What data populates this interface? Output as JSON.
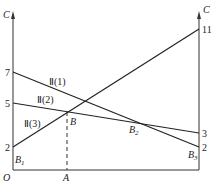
{
  "diagram": {
    "title": "",
    "axes": {
      "left_axis_label": "C",
      "right_axis_label": "C",
      "origin_label": "O",
      "x_marker_label": "A"
    },
    "left_ticks": [
      "7",
      "5",
      "2"
    ],
    "right_ticks": [
      "11",
      "3",
      "2"
    ],
    "lines": [
      {
        "name": "II (1)",
        "left_value": 7,
        "right_value": 2
      },
      {
        "name": "II (2)",
        "left_value": 5,
        "right_value": 3
      },
      {
        "name": "II (3)",
        "left_value": 2,
        "right_value": 11
      }
    ],
    "points": {
      "B1": "B",
      "B1_sub": "1",
      "B": "B",
      "B2": "B",
      "B2_sub": "2",
      "B3": "B",
      "B3_sub": "3"
    },
    "line_labels": {
      "l1": "Ⅱ(1)",
      "l2": "Ⅱ(2)",
      "l3": "Ⅱ(3)"
    },
    "colors": {
      "line": "#222222",
      "background": "#ffffff"
    }
  }
}
